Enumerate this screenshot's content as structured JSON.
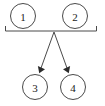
{
  "diagram": {
    "type": "node-arrow-diagram",
    "background_color": "#ffffff",
    "stroke_color": "#4a4a4a",
    "arrow_fill_color": "#2b2b2b",
    "label_color": "#1a1a1a",
    "nodes": [
      {
        "id": "n1",
        "label": "1",
        "row": "top",
        "cx": 23,
        "cy": 16,
        "r": 13
      },
      {
        "id": "n2",
        "label": "2",
        "row": "top",
        "cx": 75,
        "cy": 16,
        "r": 13
      },
      {
        "id": "n3",
        "label": "3",
        "row": "bottom",
        "cx": 35,
        "cy": 87,
        "r": 13
      },
      {
        "id": "n4",
        "label": "4",
        "row": "bottom",
        "cx": 73,
        "cy": 87,
        "r": 13
      }
    ],
    "bracket": {
      "description": "horizontal bracket under top nodes with downward end ticks",
      "left_x": 5,
      "right_x": 97,
      "bar_y": 31,
      "tick_height": 5,
      "junction_x": 54,
      "junction_y": 31
    },
    "edges": [
      {
        "id": "e1",
        "from": "bracket-junction",
        "to": "n3",
        "arrowhead": "filled",
        "x1": 54,
        "y1": 32,
        "x2": 39,
        "y2": 73
      },
      {
        "id": "e2",
        "from": "bracket-junction",
        "to": "n4",
        "arrowhead": "filled",
        "x1": 54,
        "y1": 32,
        "x2": 69,
        "y2": 73
      }
    ]
  }
}
